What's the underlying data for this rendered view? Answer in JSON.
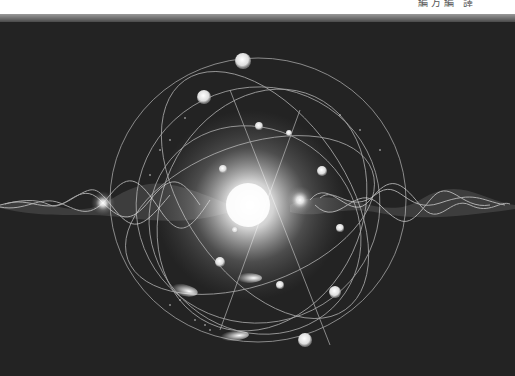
{
  "header": {
    "running_head": "編方編 譯"
  },
  "figure": {
    "background_color": "#232323",
    "glow_color": "#ffffff"
  }
}
